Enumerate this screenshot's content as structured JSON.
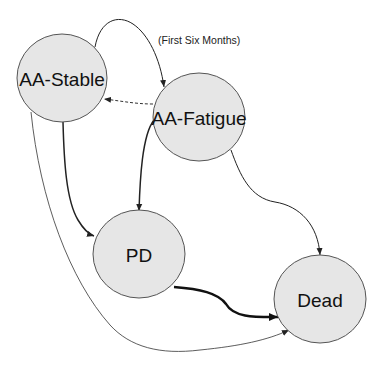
{
  "diagram": {
    "type": "state-transition",
    "colors": {
      "node_fill": "#e6e6e6",
      "node_stroke": "#555555",
      "edge": "#222222",
      "background": "#ffffff"
    },
    "nodes": [
      {
        "id": "aa-stable",
        "label": "AA-Stable"
      },
      {
        "id": "aa-fatigue",
        "label": "AA-Fatigue"
      },
      {
        "id": "pd",
        "label": "PD"
      },
      {
        "id": "dead",
        "label": "Dead"
      }
    ],
    "edges": [
      {
        "from": "AA-Stable",
        "to": "AA-Fatigue",
        "label": "(First Six Months)",
        "style": "solid"
      },
      {
        "from": "AA-Fatigue",
        "to": "AA-Stable",
        "label": "",
        "style": "dashed"
      },
      {
        "from": "AA-Stable",
        "to": "PD",
        "label": "",
        "style": "solid-medium"
      },
      {
        "from": "AA-Fatigue",
        "to": "PD",
        "label": "",
        "style": "solid-medium"
      },
      {
        "from": "AA-Fatigue",
        "to": "Dead",
        "label": "",
        "style": "solid"
      },
      {
        "from": "PD",
        "to": "Dead",
        "label": "",
        "style": "solid-thick"
      },
      {
        "from": "AA-Stable",
        "to": "Dead",
        "label": "",
        "style": "solid-thin"
      }
    ]
  }
}
